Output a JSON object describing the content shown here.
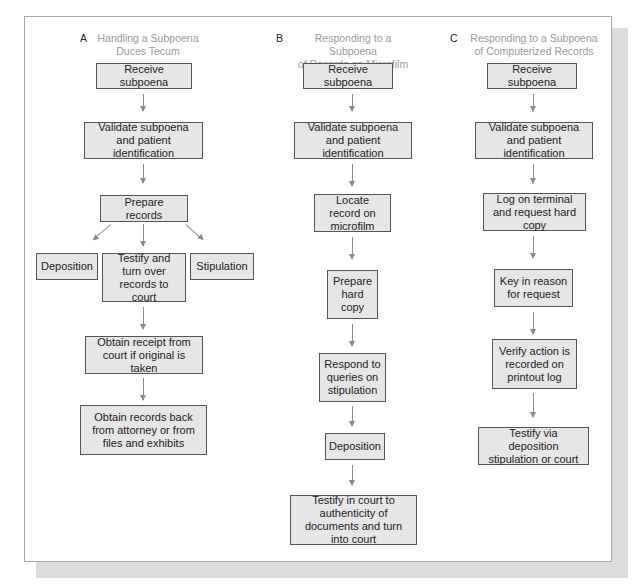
{
  "diagram": {
    "columns": [
      {
        "letter": "A",
        "title_line1": "Handling a Subpoena",
        "title_line2": "Duces Tecum",
        "steps": [
          "Receive subpoena",
          "Validate subpoena and patient identification",
          "Prepare records",
          "Testify and turn over records to court",
          "Obtain receipt from court if original is taken",
          "Obtain records back from attorney or from files and exhibits"
        ],
        "branches": {
          "left": "Deposition",
          "right": "Stipulation"
        }
      },
      {
        "letter": "B",
        "title_line1": "Responding to a Subpoena",
        "title_line2": "of Records on Microfilm",
        "steps": [
          "Receive subpoena",
          "Validate subpoena and patient identification",
          "Locate record on microfilm",
          "Prepare hard copy",
          "Respond to queries on stipulation",
          "Deposition",
          "Testify in court to authenticity of documents and turn into court"
        ]
      },
      {
        "letter": "C",
        "title_line1": "Responding to a Subpoena",
        "title_line2": "of Computerized Records",
        "steps": [
          "Receive subpoena",
          "Validate subpoena and patient identification",
          "Log on terminal and request hard copy",
          "Key in reason for request",
          "Verify action is recorded on printout log",
          "Testify via deposition stipulation or court"
        ]
      }
    ]
  },
  "colors": {
    "box_fill": "#e6e6e6",
    "box_border": "#555555",
    "arrow": "#8a8a8a",
    "title_text": "#9a9a9a",
    "shadow": "#dcdcdc"
  }
}
